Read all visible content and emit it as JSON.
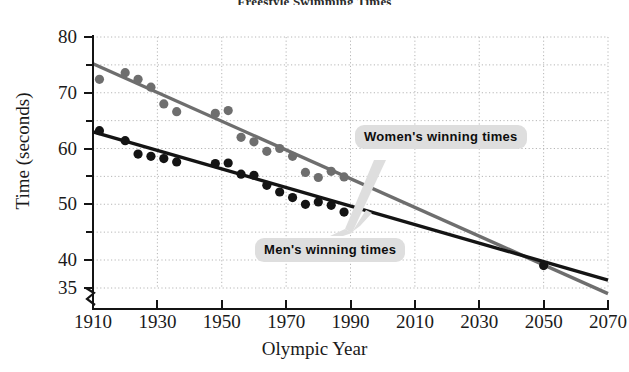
{
  "title": "Freestyle Swimming Times",
  "axis": {
    "x_title": "Olympic Year",
    "y_title": "Time (seconds)"
  },
  "callouts": {
    "women": "Women's winning times",
    "men": "Men's winning times"
  },
  "colors": {
    "men_line": "#141414",
    "women_line": "#6e6e6e",
    "grid": "#b6b6b6",
    "callout_bg": "#dedede",
    "axis": "#141414"
  },
  "chart_data": {
    "type": "scatter",
    "title": "Freestyle Swimming Times",
    "xlabel": "Olympic Year",
    "ylabel": "Time (seconds)",
    "xlim": [
      1910,
      2070
    ],
    "ylim": [
      35,
      80
    ],
    "xticks": [
      1910,
      1930,
      1950,
      1970,
      1990,
      2010,
      2030,
      2050,
      2070
    ],
    "yticks": [
      80,
      70,
      60,
      50,
      40,
      35
    ],
    "yticks_minor": [
      75,
      65,
      55,
      45
    ],
    "grid": true,
    "y_axis_break": true,
    "legend": "callouts on plot",
    "series": [
      {
        "name": "Women's winning times",
        "color": "#6e6e6e",
        "points": [
          [
            1912,
            72.4
          ],
          [
            1920,
            73.6
          ],
          [
            1924,
            72.4
          ],
          [
            1928,
            71.0
          ],
          [
            1932,
            68.0
          ],
          [
            1936,
            66.6
          ],
          [
            1948,
            66.3
          ],
          [
            1952,
            66.8
          ],
          [
            1956,
            62.0
          ],
          [
            1960,
            61.2
          ],
          [
            1964,
            59.5
          ],
          [
            1968,
            60.0
          ],
          [
            1972,
            58.6
          ],
          [
            1976,
            55.7
          ],
          [
            1980,
            54.8
          ],
          [
            1984,
            55.9
          ],
          [
            1988,
            54.9
          ]
        ],
        "trend": {
          "x": [
            1910,
            2070
          ],
          "y": [
            75.2,
            34.0
          ]
        }
      },
      {
        "name": "Men's winning times",
        "color": "#141414",
        "points": [
          [
            1912,
            63.2
          ],
          [
            1920,
            61.4
          ],
          [
            1924,
            59.0
          ],
          [
            1928,
            58.6
          ],
          [
            1932,
            58.2
          ],
          [
            1936,
            57.6
          ],
          [
            1948,
            57.3
          ],
          [
            1952,
            57.4
          ],
          [
            1956,
            55.4
          ],
          [
            1960,
            55.2
          ],
          [
            1964,
            53.4
          ],
          [
            1968,
            52.2
          ],
          [
            1972,
            51.2
          ],
          [
            1976,
            49.99
          ],
          [
            1980,
            50.4
          ],
          [
            1984,
            49.8
          ],
          [
            1988,
            48.6
          ],
          [
            2050,
            39.0
          ]
        ],
        "trend": {
          "x": [
            1910,
            2070
          ],
          "y": [
            63.0,
            36.4
          ]
        }
      }
    ],
    "annotations": [
      {
        "label": "Women's winning times",
        "x": 2008,
        "y": 59.5
      },
      {
        "label": "Men's winning times",
        "x": 1975,
        "y": 41.5
      }
    ]
  }
}
